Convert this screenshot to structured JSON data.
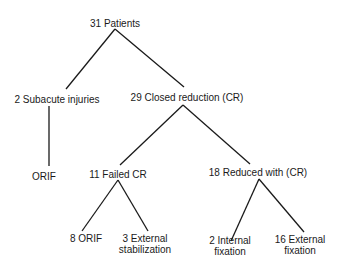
{
  "diagram": {
    "type": "tree",
    "nodes": {
      "root": {
        "label": "31 Patients"
      },
      "subacute": {
        "label": "2 Subacute injuries"
      },
      "closed_reduction": {
        "label": "29 Closed reduction (CR)"
      },
      "orif_subacute": {
        "label": "ORIF"
      },
      "failed_cr": {
        "label": "11 Failed CR"
      },
      "reduced_cr": {
        "label": "18 Reduced with (CR)"
      },
      "orif_failed": {
        "label": "8 ORIF"
      },
      "external_stabilization": {
        "line1": "3 External",
        "line2": "stabilization"
      },
      "internal_fixation": {
        "line1": "2 Internal",
        "line2": "fixation"
      },
      "external_fixation": {
        "line1": "16 External",
        "line2": "fixation"
      }
    },
    "edges": [
      [
        "root",
        "subacute"
      ],
      [
        "root",
        "closed_reduction"
      ],
      [
        "subacute",
        "orif_subacute"
      ],
      [
        "closed_reduction",
        "failed_cr"
      ],
      [
        "closed_reduction",
        "reduced_cr"
      ],
      [
        "failed_cr",
        "orif_failed"
      ],
      [
        "failed_cr",
        "external_stabilization"
      ],
      [
        "reduced_cr",
        "internal_fixation"
      ],
      [
        "reduced_cr",
        "external_fixation"
      ]
    ]
  }
}
